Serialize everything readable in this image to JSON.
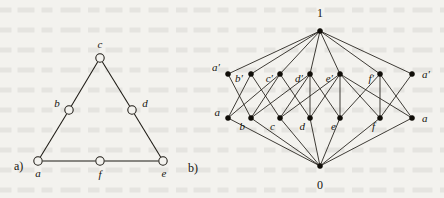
{
  "figure": {
    "panels": [
      {
        "tag": "a)",
        "kind": "graph",
        "description": "triangle graph with six vertices",
        "vertices": [
          {
            "id": "c",
            "label": "c",
            "x": 100,
            "y": 58,
            "label_x": 100,
            "label_y": 48,
            "label_anchor": "middle"
          },
          {
            "id": "b",
            "label": "b",
            "x": 69,
            "y": 110,
            "label_x": 57,
            "label_y": 107,
            "label_anchor": "middle"
          },
          {
            "id": "d",
            "label": "d",
            "x": 132,
            "y": 110,
            "label_x": 145,
            "label_y": 107,
            "label_anchor": "middle"
          },
          {
            "id": "a",
            "label": "a",
            "x": 38,
            "y": 161,
            "label_x": 38,
            "label_y": 177,
            "label_anchor": "middle"
          },
          {
            "id": "f",
            "label": "f",
            "x": 100,
            "y": 161,
            "label_x": 100,
            "label_y": 178,
            "label_anchor": "middle"
          },
          {
            "id": "e",
            "label": "e",
            "x": 163,
            "y": 161,
            "label_x": 164,
            "label_y": 177,
            "label_anchor": "middle"
          }
        ],
        "edges": [
          [
            "a",
            "b"
          ],
          [
            "b",
            "c"
          ],
          [
            "c",
            "d"
          ],
          [
            "d",
            "e"
          ],
          [
            "a",
            "f"
          ],
          [
            "f",
            "e"
          ]
        ],
        "tag_x": 14,
        "tag_y": 170
      },
      {
        "tag": "b)",
        "kind": "lattice",
        "description": "Hasse diagram of the lattice with top 1, bottom 0, atoms and coatoms",
        "top": {
          "id": "one",
          "label": "1",
          "x": 320,
          "y": 31,
          "label_x": 320,
          "label_y": 17
        },
        "bottom": {
          "id": "zero",
          "label": "0",
          "x": 320,
          "y": 166,
          "label_x": 320,
          "label_y": 189
        },
        "coatoms": [
          {
            "id": "ap_l",
            "label": "a′",
            "x": 228,
            "y": 74,
            "label_x": 220,
            "label_y": 71,
            "label_anchor": "end"
          },
          {
            "id": "bp",
            "label": "b′",
            "x": 251,
            "y": 74,
            "label_x": 243,
            "label_y": 82,
            "label_anchor": "end"
          },
          {
            "id": "cp",
            "label": "c′",
            "x": 280,
            "y": 74,
            "label_x": 273,
            "label_y": 82,
            "label_anchor": "end"
          },
          {
            "id": "dp",
            "label": "d′",
            "x": 310,
            "y": 74,
            "label_x": 303,
            "label_y": 82,
            "label_anchor": "end"
          },
          {
            "id": "ep",
            "label": "e′",
            "x": 340,
            "y": 74,
            "label_x": 333,
            "label_y": 82,
            "label_anchor": "end"
          },
          {
            "id": "fp",
            "label": "f′",
            "x": 380,
            "y": 74,
            "label_x": 374,
            "label_y": 82,
            "label_anchor": "end"
          },
          {
            "id": "ap_r",
            "label": "a′",
            "x": 412,
            "y": 74,
            "label_x": 422,
            "label_y": 78,
            "label_anchor": "start"
          }
        ],
        "atoms": [
          {
            "id": "a_l",
            "label": "a",
            "x": 228,
            "y": 118,
            "label_x": 220,
            "label_y": 116,
            "label_anchor": "end"
          },
          {
            "id": "b",
            "label": "b",
            "x": 251,
            "y": 118,
            "label_x": 245,
            "label_y": 130,
            "label_anchor": "end"
          },
          {
            "id": "c",
            "label": "c",
            "x": 280,
            "y": 118,
            "label_x": 275,
            "label_y": 130,
            "label_anchor": "end"
          },
          {
            "id": "d",
            "label": "d",
            "x": 310,
            "y": 118,
            "label_x": 305,
            "label_y": 130,
            "label_anchor": "end"
          },
          {
            "id": "e",
            "label": "e",
            "x": 340,
            "y": 118,
            "label_x": 336,
            "label_y": 130,
            "label_anchor": "end"
          },
          {
            "id": "f",
            "label": "f",
            "x": 380,
            "y": 118,
            "label_x": 375,
            "label_y": 130,
            "label_anchor": "end"
          },
          {
            "id": "a_r",
            "label": "a",
            "x": 412,
            "y": 118,
            "label_x": 422,
            "label_y": 122,
            "label_anchor": "start"
          }
        ],
        "middle_edges": [
          [
            "a_l",
            "bp"
          ],
          [
            "a_l",
            "cp"
          ],
          [
            "b",
            "ap_l"
          ],
          [
            "b",
            "cp"
          ],
          [
            "b",
            "dp"
          ],
          [
            "c",
            "bp"
          ],
          [
            "c",
            "dp"
          ],
          [
            "c",
            "ep"
          ],
          [
            "d",
            "cp"
          ],
          [
            "d",
            "ep"
          ],
          [
            "d",
            "dp"
          ],
          [
            "e",
            "dp"
          ],
          [
            "e",
            "fp"
          ],
          [
            "e",
            "ep"
          ],
          [
            "f",
            "ep"
          ],
          [
            "f",
            "ap_r"
          ],
          [
            "f",
            "fp"
          ],
          [
            "a_r",
            "fp"
          ],
          [
            "a_r",
            "ep"
          ]
        ],
        "tag_x": 188,
        "tag_y": 172
      }
    ]
  },
  "colors": {
    "ink": "#1d1a14",
    "node_fill": "#100e09",
    "paper": "#f3f2ee"
  }
}
